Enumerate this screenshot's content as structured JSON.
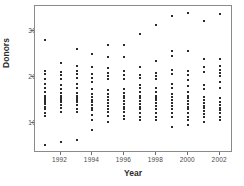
{
  "chart_data": {
    "type": "scatter",
    "title": "",
    "xlabel": "Year",
    "ylabel": "Donors",
    "xlim": [
      1990.4,
      2002.8
    ],
    "ylim": [
      3.5,
      35.5
    ],
    "xticks": [
      1992,
      1994,
      1996,
      1998,
      2000,
      2002
    ],
    "yticks": [
      10,
      20,
      30
    ],
    "grid": false,
    "legend": null,
    "marker_color": "#2b2b2b",
    "frame_color": "#8a8a8a",
    "categories": [
      1991,
      1992,
      1993,
      1994,
      1995,
      1996,
      1997,
      1998,
      1999,
      2000,
      2001,
      2002
    ],
    "series": [
      {
        "name": "Donors per year",
        "points": [
          {
            "x": 1991,
            "y": 28.0
          },
          {
            "x": 1991,
            "y": 21.4
          },
          {
            "x": 1991,
            "y": 20.6
          },
          {
            "x": 1991,
            "y": 19.6
          },
          {
            "x": 1991,
            "y": 18.6
          },
          {
            "x": 1991,
            "y": 17.6
          },
          {
            "x": 1991,
            "y": 16.8
          },
          {
            "x": 1991,
            "y": 16.0
          },
          {
            "x": 1991,
            "y": 15.4
          },
          {
            "x": 1991,
            "y": 15.0
          },
          {
            "x": 1991,
            "y": 14.6
          },
          {
            "x": 1991,
            "y": 14.2
          },
          {
            "x": 1991,
            "y": 13.6
          },
          {
            "x": 1991,
            "y": 13.0
          },
          {
            "x": 1991,
            "y": 12.2
          },
          {
            "x": 1991,
            "y": 11.6
          },
          {
            "x": 1991,
            "y": 5.2
          },
          {
            "x": 1992,
            "y": 23.0
          },
          {
            "x": 1992,
            "y": 21.2
          },
          {
            "x": 1992,
            "y": 20.4
          },
          {
            "x": 1992,
            "y": 19.6
          },
          {
            "x": 1992,
            "y": 18.4
          },
          {
            "x": 1992,
            "y": 17.4
          },
          {
            "x": 1992,
            "y": 16.6
          },
          {
            "x": 1992,
            "y": 16.0
          },
          {
            "x": 1992,
            "y": 15.4
          },
          {
            "x": 1992,
            "y": 15.0
          },
          {
            "x": 1992,
            "y": 14.6
          },
          {
            "x": 1992,
            "y": 14.0
          },
          {
            "x": 1992,
            "y": 13.4
          },
          {
            "x": 1992,
            "y": 12.4
          },
          {
            "x": 1992,
            "y": 6.0
          },
          {
            "x": 1993,
            "y": 26.2
          },
          {
            "x": 1993,
            "y": 22.4
          },
          {
            "x": 1993,
            "y": 21.4
          },
          {
            "x": 1993,
            "y": 20.6
          },
          {
            "x": 1993,
            "y": 19.8
          },
          {
            "x": 1993,
            "y": 18.6
          },
          {
            "x": 1993,
            "y": 17.6
          },
          {
            "x": 1993,
            "y": 16.6
          },
          {
            "x": 1993,
            "y": 16.0
          },
          {
            "x": 1993,
            "y": 15.4
          },
          {
            "x": 1993,
            "y": 15.0
          },
          {
            "x": 1993,
            "y": 14.6
          },
          {
            "x": 1993,
            "y": 14.0
          },
          {
            "x": 1993,
            "y": 13.0
          },
          {
            "x": 1993,
            "y": 12.4
          },
          {
            "x": 1993,
            "y": 6.4
          },
          {
            "x": 1994,
            "y": 25.0
          },
          {
            "x": 1994,
            "y": 22.2
          },
          {
            "x": 1994,
            "y": 20.6
          },
          {
            "x": 1994,
            "y": 19.8
          },
          {
            "x": 1994,
            "y": 19.0
          },
          {
            "x": 1994,
            "y": 17.4
          },
          {
            "x": 1994,
            "y": 16.4
          },
          {
            "x": 1994,
            "y": 15.6
          },
          {
            "x": 1994,
            "y": 15.0
          },
          {
            "x": 1994,
            "y": 14.6
          },
          {
            "x": 1994,
            "y": 14.0
          },
          {
            "x": 1994,
            "y": 13.4
          },
          {
            "x": 1994,
            "y": 12.8
          },
          {
            "x": 1994,
            "y": 11.8
          },
          {
            "x": 1994,
            "y": 10.6
          },
          {
            "x": 1994,
            "y": 8.4
          },
          {
            "x": 1995,
            "y": 27.0
          },
          {
            "x": 1995,
            "y": 24.4
          },
          {
            "x": 1995,
            "y": 22.0
          },
          {
            "x": 1995,
            "y": 21.0
          },
          {
            "x": 1995,
            "y": 20.2
          },
          {
            "x": 1995,
            "y": 19.6
          },
          {
            "x": 1995,
            "y": 17.2
          },
          {
            "x": 1995,
            "y": 16.4
          },
          {
            "x": 1995,
            "y": 15.6
          },
          {
            "x": 1995,
            "y": 15.0
          },
          {
            "x": 1995,
            "y": 14.4
          },
          {
            "x": 1995,
            "y": 13.8
          },
          {
            "x": 1995,
            "y": 13.0
          },
          {
            "x": 1995,
            "y": 12.4
          },
          {
            "x": 1995,
            "y": 11.6
          },
          {
            "x": 1995,
            "y": 10.2
          },
          {
            "x": 1996,
            "y": 27.0
          },
          {
            "x": 1996,
            "y": 24.4
          },
          {
            "x": 1996,
            "y": 21.4
          },
          {
            "x": 1996,
            "y": 20.4
          },
          {
            "x": 1996,
            "y": 19.6
          },
          {
            "x": 1996,
            "y": 17.4
          },
          {
            "x": 1996,
            "y": 16.6
          },
          {
            "x": 1996,
            "y": 16.0
          },
          {
            "x": 1996,
            "y": 15.4
          },
          {
            "x": 1996,
            "y": 14.8
          },
          {
            "x": 1996,
            "y": 14.2
          },
          {
            "x": 1996,
            "y": 13.6
          },
          {
            "x": 1996,
            "y": 13.0
          },
          {
            "x": 1996,
            "y": 12.4
          },
          {
            "x": 1996,
            "y": 11.6
          },
          {
            "x": 1996,
            "y": 10.8
          },
          {
            "x": 1997,
            "y": 29.4
          },
          {
            "x": 1997,
            "y": 22.2
          },
          {
            "x": 1997,
            "y": 20.4
          },
          {
            "x": 1997,
            "y": 19.8
          },
          {
            "x": 1997,
            "y": 18.4
          },
          {
            "x": 1997,
            "y": 17.6
          },
          {
            "x": 1997,
            "y": 16.8
          },
          {
            "x": 1997,
            "y": 16.0
          },
          {
            "x": 1997,
            "y": 15.4
          },
          {
            "x": 1997,
            "y": 14.8
          },
          {
            "x": 1997,
            "y": 14.2
          },
          {
            "x": 1997,
            "y": 13.6
          },
          {
            "x": 1997,
            "y": 13.0
          },
          {
            "x": 1997,
            "y": 12.2
          },
          {
            "x": 1997,
            "y": 11.4
          },
          {
            "x": 1997,
            "y": 10.6
          },
          {
            "x": 1998,
            "y": 31.4
          },
          {
            "x": 1998,
            "y": 23.6
          },
          {
            "x": 1998,
            "y": 21.0
          },
          {
            "x": 1998,
            "y": 20.2
          },
          {
            "x": 1998,
            "y": 19.6
          },
          {
            "x": 1998,
            "y": 17.6
          },
          {
            "x": 1998,
            "y": 16.8
          },
          {
            "x": 1998,
            "y": 16.0
          },
          {
            "x": 1998,
            "y": 15.4
          },
          {
            "x": 1998,
            "y": 15.0
          },
          {
            "x": 1998,
            "y": 14.4
          },
          {
            "x": 1998,
            "y": 13.8
          },
          {
            "x": 1998,
            "y": 13.0
          },
          {
            "x": 1998,
            "y": 12.2
          },
          {
            "x": 1998,
            "y": 11.4
          },
          {
            "x": 1998,
            "y": 10.6
          },
          {
            "x": 1999,
            "y": 33.4
          },
          {
            "x": 1999,
            "y": 25.6
          },
          {
            "x": 1999,
            "y": 24.6
          },
          {
            "x": 1999,
            "y": 21.6
          },
          {
            "x": 1999,
            "y": 20.6
          },
          {
            "x": 1999,
            "y": 18.6
          },
          {
            "x": 1999,
            "y": 17.6
          },
          {
            "x": 1999,
            "y": 16.4
          },
          {
            "x": 1999,
            "y": 15.6
          },
          {
            "x": 1999,
            "y": 15.0
          },
          {
            "x": 1999,
            "y": 14.4
          },
          {
            "x": 1999,
            "y": 13.8
          },
          {
            "x": 1999,
            "y": 13.0
          },
          {
            "x": 1999,
            "y": 12.2
          },
          {
            "x": 1999,
            "y": 11.4
          },
          {
            "x": 1999,
            "y": 9.2
          },
          {
            "x": 2000,
            "y": 34.0
          },
          {
            "x": 2000,
            "y": 25.6
          },
          {
            "x": 2000,
            "y": 21.4
          },
          {
            "x": 2000,
            "y": 20.4
          },
          {
            "x": 2000,
            "y": 19.4
          },
          {
            "x": 2000,
            "y": 18.0
          },
          {
            "x": 2000,
            "y": 16.8
          },
          {
            "x": 2000,
            "y": 16.0
          },
          {
            "x": 2000,
            "y": 15.4
          },
          {
            "x": 2000,
            "y": 14.8
          },
          {
            "x": 2000,
            "y": 14.2
          },
          {
            "x": 2000,
            "y": 13.6
          },
          {
            "x": 2000,
            "y": 13.0
          },
          {
            "x": 2000,
            "y": 12.2
          },
          {
            "x": 2000,
            "y": 11.4
          },
          {
            "x": 2000,
            "y": 10.6
          },
          {
            "x": 2000,
            "y": 9.6
          },
          {
            "x": 2001,
            "y": 32.2
          },
          {
            "x": 2001,
            "y": 24.0
          },
          {
            "x": 2001,
            "y": 22.2
          },
          {
            "x": 2001,
            "y": 21.2
          },
          {
            "x": 2001,
            "y": 18.2
          },
          {
            "x": 2001,
            "y": 17.4
          },
          {
            "x": 2001,
            "y": 15.6
          },
          {
            "x": 2001,
            "y": 15.0
          },
          {
            "x": 2001,
            "y": 14.4
          },
          {
            "x": 2001,
            "y": 13.8
          },
          {
            "x": 2001,
            "y": 13.2
          },
          {
            "x": 2001,
            "y": 12.6
          },
          {
            "x": 2001,
            "y": 12.0
          },
          {
            "x": 2001,
            "y": 11.4
          },
          {
            "x": 2001,
            "y": 10.2
          },
          {
            "x": 2002,
            "y": 33.8
          },
          {
            "x": 2002,
            "y": 24.0
          },
          {
            "x": 2002,
            "y": 22.4
          },
          {
            "x": 2002,
            "y": 21.6
          },
          {
            "x": 2002,
            "y": 21.0
          },
          {
            "x": 2002,
            "y": 20.2
          },
          {
            "x": 2002,
            "y": 19.0
          },
          {
            "x": 2002,
            "y": 17.6
          },
          {
            "x": 2002,
            "y": 15.4
          },
          {
            "x": 2002,
            "y": 14.6
          },
          {
            "x": 2002,
            "y": 14.0
          },
          {
            "x": 2002,
            "y": 13.4
          },
          {
            "x": 2002,
            "y": 12.8
          },
          {
            "x": 2002,
            "y": 12.2
          },
          {
            "x": 2002,
            "y": 11.4
          },
          {
            "x": 2002,
            "y": 10.6
          }
        ]
      }
    ]
  }
}
